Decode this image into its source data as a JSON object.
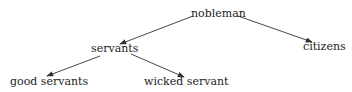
{
  "nodes": {
    "nobleman": {
      "label": "nobleman",
      "x": 191,
      "y": 7
    },
    "citizens": {
      "label": "citizens",
      "x": 303,
      "y": 40
    },
    "servants": {
      "label": "servants",
      "x": 91,
      "y": 42
    },
    "good_servants": {
      "label": "good servants",
      "x": 10,
      "y": 75
    },
    "wicked_servant": {
      "label": "wicked servant",
      "x": 144,
      "y": 75
    }
  },
  "edges": [
    {
      "from": "nobleman",
      "to": "servants",
      "x1": 193,
      "y1": 16,
      "x2": 120,
      "y2": 44
    },
    {
      "from": "nobleman",
      "to": "citizens",
      "x1": 238,
      "y1": 16,
      "x2": 312,
      "y2": 42
    },
    {
      "from": "servants",
      "to": "good_servants",
      "x1": 100,
      "y1": 56,
      "x2": 47,
      "y2": 76
    },
    {
      "from": "servants",
      "to": "wicked_servant",
      "x1": 131,
      "y1": 54,
      "x2": 184,
      "y2": 77
    }
  ],
  "colors": {
    "line": "#333333",
    "text": "#222222"
  }
}
